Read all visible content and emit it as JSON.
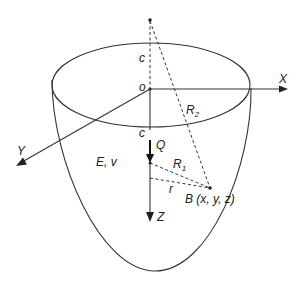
{
  "diagram": {
    "labels": {
      "x_axis": "X",
      "y_axis": "Y",
      "z_axis": "Z",
      "origin": "o",
      "c_upper": "c",
      "c_lower": "c",
      "load": "Q",
      "material": "E, v",
      "r1": "R",
      "r1_sub": "1",
      "r2": "R",
      "r2_sub": "2",
      "r": "r",
      "point": "B (x, y, z)"
    },
    "colors": {
      "line": "#333333",
      "background": "#ffffff"
    }
  }
}
